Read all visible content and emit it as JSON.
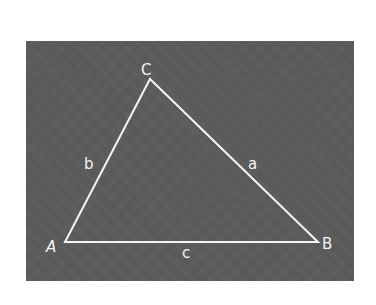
{
  "diagram": {
    "type": "triangle",
    "background_color": "#5a5a5a",
    "line_color": "#f4f4f4",
    "vertices": [
      {
        "id": "A",
        "label": "A",
        "x": 65,
        "y": 242
      },
      {
        "id": "B",
        "label": "B",
        "x": 318,
        "y": 242
      },
      {
        "id": "C",
        "label": "C",
        "x": 150,
        "y": 79
      }
    ],
    "sides": [
      {
        "id": "a",
        "label": "a",
        "from": "B",
        "to": "C"
      },
      {
        "id": "b",
        "label": "b",
        "from": "A",
        "to": "C"
      },
      {
        "id": "c",
        "label": "c",
        "from": "A",
        "to": "B"
      }
    ]
  }
}
